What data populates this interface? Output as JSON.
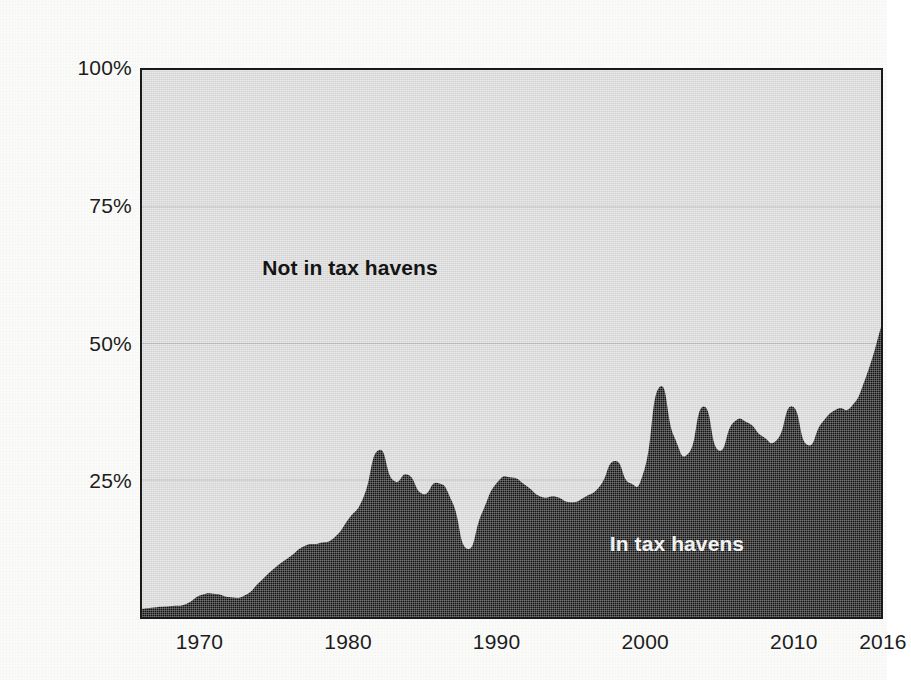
{
  "chart_data": {
    "type": "area",
    "title": "",
    "subtitle": "",
    "xlabel": "",
    "ylabel": "",
    "stacked": true,
    "grid": true,
    "legend_position": "in-plot",
    "xlim": [
      1966,
      2016
    ],
    "ylim": [
      0,
      100
    ],
    "y_tick_labels": [
      "100%",
      "75%",
      "50%",
      "25%"
    ],
    "y_ticks": [
      100,
      75,
      50,
      25
    ],
    "x_tick_labels": [
      "1970",
      "1980",
      "1990",
      "2000",
      "2010",
      "2016"
    ],
    "x_ticks": [
      1970,
      1980,
      1990,
      2000,
      2010,
      2016
    ],
    "series": [
      {
        "name": "In tax havens",
        "color": "#111111",
        "label_color": "#f2f2f2",
        "x": [
          1966,
          1967,
          1968,
          1969,
          1970,
          1971,
          1972,
          1973,
          1974,
          1975,
          1976,
          1977,
          1978,
          1979,
          1980,
          1981,
          1982,
          1983,
          1984,
          1985,
          1986,
          1987,
          1988,
          1989,
          1990,
          1991,
          1992,
          1993,
          1994,
          1995,
          1996,
          1997,
          1998,
          1999,
          2000,
          2001,
          2002,
          2003,
          2004,
          2005,
          2006,
          2007,
          2008,
          2009,
          2010,
          2011,
          2012,
          2013,
          2014,
          2015,
          2016
        ],
        "values": [
          1.5,
          1.8,
          2.0,
          2.4,
          4.0,
          4.2,
          3.6,
          4.0,
          6.5,
          9.0,
          11.0,
          13.0,
          13.5,
          14.5,
          18.0,
          22.0,
          30.5,
          25.0,
          26.0,
          22.5,
          24.5,
          21.0,
          12.5,
          19.0,
          24.5,
          25.5,
          24.0,
          22.0,
          22.0,
          21.0,
          22.0,
          24.0,
          28.5,
          24.5,
          27.0,
          42.0,
          33.0,
          30.0,
          38.5,
          30.5,
          35.5,
          35.5,
          33.0,
          32.5,
          38.5,
          31.5,
          35.5,
          38.0,
          38.5,
          44.0,
          53.0
        ]
      },
      {
        "name": "Not in tax havens",
        "color": "#d9d9d9",
        "label_color": "#141414",
        "note": "remainder up to 100%"
      }
    ],
    "annotations": [
      {
        "text": "Not in tax havens",
        "x": 1980,
        "y": 64
      },
      {
        "text": "In tax havens",
        "x": 2002,
        "y": 14
      }
    ]
  },
  "axes": {
    "y": {
      "labels": [
        {
          "text": "100%",
          "value": 100
        },
        {
          "text": "75%",
          "value": 75
        },
        {
          "text": "50%",
          "value": 50
        },
        {
          "text": "25%",
          "value": 25
        }
      ]
    },
    "x": {
      "labels": [
        {
          "text": "1970",
          "value": 1970
        },
        {
          "text": "1980",
          "value": 1980
        },
        {
          "text": "1990",
          "value": 1990
        },
        {
          "text": "2000",
          "value": 2000
        },
        {
          "text": "2010",
          "value": 2010
        },
        {
          "text": "2016",
          "value": 2016
        }
      ]
    }
  },
  "colors": {
    "plot_background": "#d9d9d9",
    "series_dark": "#111111",
    "frame": "#1a1a1a",
    "page_background": "#fbfbfa",
    "gridline": "#b5b5b5",
    "text": "#1c1c1c"
  }
}
